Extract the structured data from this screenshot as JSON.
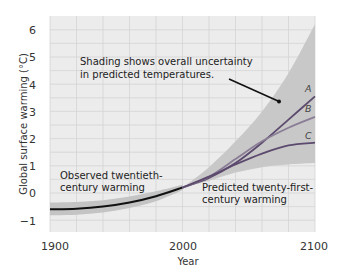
{
  "chart_data": {
    "type": "line",
    "title": "",
    "xlabel": "Year",
    "ylabel": "Global surface warming (°C)",
    "xlim": [
      1900,
      2100
    ],
    "ylim": [
      -1.4,
      6.5
    ],
    "x_ticks": [
      1900,
      2000,
      2100
    ],
    "y_ticks": [
      -1,
      0,
      1,
      2,
      3,
      4,
      5,
      6
    ],
    "grid": true,
    "grid_x_step": 20,
    "grid_y_step": 0.5,
    "colors": {
      "plot_bg": "#ececec",
      "grid": "#d4d4d4",
      "uncertainty_band": "#c8c8c8",
      "observed_band": "#c4c4c4",
      "observed_line": "#111111",
      "line_A": "#5c4a6e",
      "line_B": "#8a7d96",
      "line_C": "#5c4a6e"
    },
    "observed": {
      "name": "Observed twentieth-century warming",
      "x": [
        1900,
        1920,
        1940,
        1960,
        1980,
        2000
      ],
      "values": [
        -0.6,
        -0.58,
        -0.5,
        -0.35,
        -0.12,
        0.2
      ],
      "band_upper": [
        -0.35,
        -0.33,
        -0.27,
        -0.13,
        0.06,
        0.3
      ],
      "band_lower": [
        -0.82,
        -0.8,
        -0.72,
        -0.55,
        -0.3,
        0.1
      ]
    },
    "uncertainty": {
      "x": [
        2000,
        2020,
        2040,
        2060,
        2080,
        2100
      ],
      "upper": [
        0.2,
        0.95,
        1.9,
        3.0,
        4.4,
        6.2
      ],
      "lower": [
        0.2,
        0.45,
        0.75,
        0.95,
        1.05,
        1.1
      ]
    },
    "series": [
      {
        "name": "A",
        "x": [
          2000,
          2020,
          2040,
          2060,
          2080,
          2100
        ],
        "values": [
          0.2,
          0.55,
          1.1,
          1.85,
          2.7,
          3.55
        ]
      },
      {
        "name": "B",
        "x": [
          2000,
          2020,
          2040,
          2060,
          2080,
          2100
        ],
        "values": [
          0.2,
          0.6,
          1.25,
          1.9,
          2.4,
          2.8
        ]
      },
      {
        "name": "C",
        "x": [
          2000,
          2020,
          2040,
          2060,
          2080,
          2100
        ],
        "values": [
          0.2,
          0.6,
          1.05,
          1.45,
          1.75,
          1.85
        ]
      }
    ],
    "annotations": [
      {
        "text_lines": [
          "Shading shows overall uncertainty",
          "in predicted temperatures."
        ],
        "arrow_to": [
          2077,
          3.4
        ]
      },
      {
        "text_lines": [
          "Observed twentieth-",
          "century warming"
        ]
      },
      {
        "text_lines": [
          "Predicted twenty-first-",
          "century warming"
        ]
      }
    ]
  },
  "labels": {
    "ylabel": "Global surface warming (°C)",
    "xlabel": "Year",
    "x_ticks": [
      "1900",
      "2000",
      "2100"
    ],
    "y_ticks": [
      "6",
      "5",
      "4",
      "3",
      "2",
      "1",
      "0",
      "−1"
    ],
    "annot1_line1": "Shading shows overall uncertainty",
    "annot1_line2": "in predicted temperatures.",
    "annot2_line1": "Observed twentieth-",
    "annot2_line2": "century warming",
    "annot3_line1": "Predicted twenty-first-",
    "annot3_line2": "century warming",
    "series_A": "A",
    "series_B": "B",
    "series_C": "C"
  }
}
